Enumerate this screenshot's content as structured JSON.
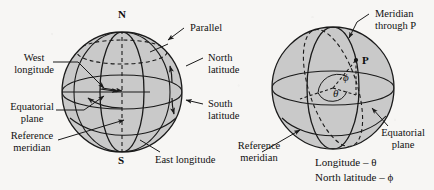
{
  "figure": {
    "background_color": "#f7f6f4",
    "sphere_fill_color": "#c9c9c9",
    "line_color": "#1a1a1a",
    "left_diagram": {
      "poles": {
        "north": "N",
        "south": "S"
      },
      "labels": {
        "parallel": "Parallel",
        "north_latitude_line1": "North",
        "north_latitude_line2": "latitude",
        "south_latitude_line1": "South",
        "south_latitude_line2": "latitude",
        "west_longitude_line1": "West",
        "west_longitude_line2": "longitude",
        "east_longitude": "East longitude",
        "equatorial_plane_line1": "Equatorial",
        "equatorial_plane_line2": "plane",
        "reference_meridian_line1": "Reference",
        "reference_meridian_line2": "meridian"
      }
    },
    "right_diagram": {
      "point_label": "P",
      "angle_phi": "ϕ",
      "angle_theta": "θ",
      "labels": {
        "meridian_line1": "Meridian",
        "meridian_line2": "through P",
        "equatorial_plane_line1": "Equatorial",
        "equatorial_plane_line2": "plane",
        "reference_meridian_line1": "Reference",
        "reference_meridian_line2": "meridian"
      },
      "captions": {
        "longitude": "Longitude – θ",
        "north_latitude": "North latitude – ϕ"
      }
    }
  }
}
